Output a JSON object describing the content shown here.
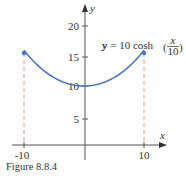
{
  "chart_data": {
    "type": "line",
    "title": "",
    "equation_label": {
      "lhs": "y = 10 cosh",
      "num": "x",
      "den": "10"
    },
    "xlabel": "x",
    "ylabel": "y",
    "x_ticks": [
      "-10",
      "10"
    ],
    "y_ticks": [
      "5",
      "10",
      "15",
      "20"
    ],
    "xlim": [
      -12,
      13
    ],
    "ylim": [
      0,
      23
    ],
    "x": [
      -10,
      -8,
      -6,
      -4,
      -2,
      0,
      2,
      4,
      6,
      8,
      10
    ],
    "values": [
      15.43,
      13.37,
      11.85,
      10.81,
      10.2,
      10.0,
      10.2,
      10.81,
      11.85,
      13.37,
      15.43
    ],
    "endpoints": [
      {
        "x": -10,
        "y": 15.43
      },
      {
        "x": 10,
        "y": 15.43
      }
    ],
    "dashed_verticals": [
      -10,
      10
    ],
    "curve_color": "#4a78c8",
    "dashed_color": "#e8967a",
    "grid": false
  },
  "caption": "Figure 8.8.4"
}
